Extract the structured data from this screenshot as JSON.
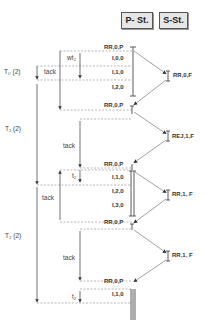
{
  "headers": {
    "primary": "P- St.",
    "secondary": "S-St."
  },
  "primary_frames": [
    {
      "label": "RR,0,P",
      "y": 47
    },
    {
      "label": "I,0,0",
      "y": 58
    },
    {
      "label": "I,1,0",
      "y": 72
    },
    {
      "label": "I,2,0",
      "y": 87
    },
    {
      "label": "RR,0,P",
      "y": 105
    },
    {
      "label": "RR,0,P",
      "y": 164
    },
    {
      "label": "I,1,0",
      "y": 177
    },
    {
      "label": "I,2,0",
      "y": 191
    },
    {
      "label": "I,3,0",
      "y": 205
    },
    {
      "label": "RR,0,P",
      "y": 222
    },
    {
      "label": "RR,0,P",
      "y": 281
    },
    {
      "label": "I,1,0",
      "y": 294
    }
  ],
  "secondary_frames": [
    {
      "label": "RR,0,F",
      "y": 75
    },
    {
      "label": "REJ,1,F",
      "y": 136
    },
    {
      "label": "RR,1, F",
      "y": 194
    },
    {
      "label": "RR,1, F",
      "y": 255
    }
  ],
  "timing_labels": {
    "wt2": "wt₂",
    "t0": "T₀ (2)",
    "tack1": "tack",
    "t1": "T₁ (2)",
    "tack2": "tack",
    "t2_a": "t₂",
    "tack3": "tack",
    "t2": "T₂ (2)",
    "tack4": "tack",
    "t2_b": "t₂"
  }
}
